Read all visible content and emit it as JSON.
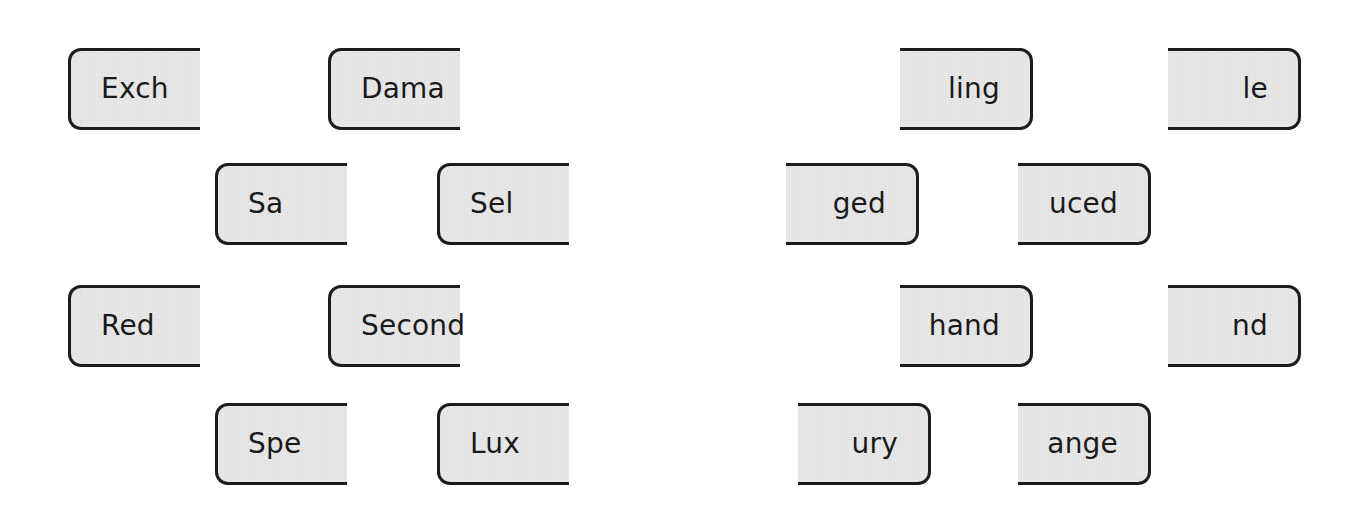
{
  "page": {
    "background_color": "#ffffff"
  },
  "style_tokens": {
    "tile_fill": "#e9e9e9",
    "tile_border": "#1c1c1c",
    "text_color": "#1a1a1a"
  },
  "board": {
    "columns": [
      {
        "id": "prefix-column",
        "name": "word-beginnings",
        "shape": "rounded-left-flat-right"
      },
      {
        "id": "suffix-column",
        "name": "word-endings",
        "shape": "flat-left-rounded-right"
      }
    ],
    "tiles": [
      {
        "id": "tile-exch",
        "label": "Exch",
        "side": "prefix",
        "row": 1,
        "x": 68,
        "y": 48,
        "width": 132
      },
      {
        "id": "tile-dama",
        "label": "Dama",
        "side": "prefix",
        "row": 1,
        "x": 328,
        "y": 48,
        "width": 132
      },
      {
        "id": "tile-ling",
        "label": "ling",
        "side": "suffix",
        "row": 1,
        "x": 900,
        "y": 48,
        "width": 133
      },
      {
        "id": "tile-le",
        "label": "le",
        "side": "suffix",
        "row": 1,
        "x": 1168,
        "y": 48,
        "width": 133
      },
      {
        "id": "tile-sa",
        "label": "Sa",
        "side": "prefix",
        "row": 2,
        "x": 215,
        "y": 163,
        "width": 132
      },
      {
        "id": "tile-sel",
        "label": "Sel",
        "side": "prefix",
        "row": 2,
        "x": 437,
        "y": 163,
        "width": 132
      },
      {
        "id": "tile-ged",
        "label": "ged",
        "side": "suffix",
        "row": 2,
        "x": 786,
        "y": 163,
        "width": 133
      },
      {
        "id": "tile-uced",
        "label": "uced",
        "side": "suffix",
        "row": 2,
        "x": 1018,
        "y": 163,
        "width": 133
      },
      {
        "id": "tile-red",
        "label": "Red",
        "side": "prefix",
        "row": 3,
        "x": 68,
        "y": 285,
        "width": 132
      },
      {
        "id": "tile-second",
        "label": "Second",
        "side": "prefix",
        "row": 3,
        "x": 328,
        "y": 285,
        "width": 132
      },
      {
        "id": "tile-hand",
        "label": "hand",
        "side": "suffix",
        "row": 3,
        "x": 900,
        "y": 285,
        "width": 133
      },
      {
        "id": "tile-nd",
        "label": "nd",
        "side": "suffix",
        "row": 3,
        "x": 1168,
        "y": 285,
        "width": 133
      },
      {
        "id": "tile-spe",
        "label": "Spe",
        "side": "prefix",
        "row": 4,
        "x": 215,
        "y": 403,
        "width": 132
      },
      {
        "id": "tile-lux",
        "label": "Lux",
        "side": "prefix",
        "row": 4,
        "x": 437,
        "y": 403,
        "width": 132
      },
      {
        "id": "tile-ury",
        "label": "ury",
        "side": "suffix",
        "row": 4,
        "x": 798,
        "y": 403,
        "width": 133
      },
      {
        "id": "tile-ange",
        "label": "ange",
        "side": "suffix",
        "row": 4,
        "x": 1018,
        "y": 403,
        "width": 133
      }
    ]
  }
}
